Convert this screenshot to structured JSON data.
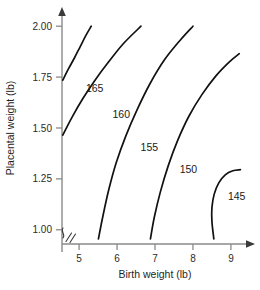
{
  "chart_data": {
    "type": "line",
    "title": "",
    "xlabel": "Birth weight (lb)",
    "ylabel": "Placental weight (lb)",
    "xlim": [
      4.55,
      9.45
    ],
    "ylim": [
      0.93,
      2.06
    ],
    "grid": false,
    "legend": "none",
    "axis_break": "x-axis origin break",
    "xticks": [
      "5",
      "6",
      "7",
      "8",
      "9"
    ],
    "xtick_values": [
      5,
      6,
      7,
      8,
      9
    ],
    "yticks": [
      "2.00",
      "1.75",
      "1.50",
      "1.25",
      "1.00"
    ],
    "ytick_values": [
      2.0,
      1.75,
      1.5,
      1.25,
      1.0
    ],
    "series": [
      {
        "name": "165",
        "label": "165",
        "label_x": 5.18,
        "label_y": 1.695,
        "points": [
          [
            4.57,
            1.735
          ],
          [
            4.72,
            1.79
          ],
          [
            4.88,
            1.845
          ],
          [
            5.03,
            1.9
          ],
          [
            5.18,
            1.955
          ],
          [
            5.32,
            2.0
          ]
        ]
      },
      {
        "name": "160",
        "label": "160",
        "label_x": 5.88,
        "label_y": 1.565,
        "points": [
          [
            4.57,
            1.465
          ],
          [
            4.82,
            1.555
          ],
          [
            5.1,
            1.645
          ],
          [
            5.42,
            1.735
          ],
          [
            5.78,
            1.825
          ],
          [
            6.17,
            1.915
          ],
          [
            6.63,
            2.0
          ]
        ]
      },
      {
        "name": "155",
        "label": "155",
        "label_x": 6.62,
        "label_y": 1.405,
        "points": [
          [
            5.51,
            0.955
          ],
          [
            5.62,
            1.06
          ],
          [
            5.78,
            1.195
          ],
          [
            5.98,
            1.33
          ],
          [
            6.23,
            1.46
          ],
          [
            6.53,
            1.59
          ],
          [
            6.86,
            1.715
          ],
          [
            7.25,
            1.835
          ],
          [
            7.68,
            1.935
          ],
          [
            8.0,
            2.0
          ]
        ]
      },
      {
        "name": "150",
        "label": "150",
        "label_x": 7.65,
        "label_y": 1.295,
        "points": [
          [
            6.88,
            0.955
          ],
          [
            6.98,
            1.06
          ],
          [
            7.14,
            1.185
          ],
          [
            7.35,
            1.315
          ],
          [
            7.6,
            1.44
          ],
          [
            7.9,
            1.56
          ],
          [
            8.24,
            1.665
          ],
          [
            8.6,
            1.755
          ],
          [
            8.96,
            1.825
          ],
          [
            9.22,
            1.865
          ]
        ]
      },
      {
        "name": "145",
        "label": "145",
        "label_x": 8.92,
        "label_y": 1.165,
        "points": [
          [
            8.55,
            0.955
          ],
          [
            8.5,
            1.04
          ],
          [
            8.5,
            1.11
          ],
          [
            8.56,
            1.175
          ],
          [
            8.68,
            1.23
          ],
          [
            8.85,
            1.27
          ],
          [
            9.05,
            1.29
          ],
          [
            9.25,
            1.295
          ]
        ]
      }
    ]
  }
}
